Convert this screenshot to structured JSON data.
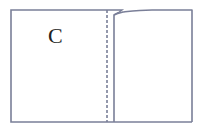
{
  "diagram": {
    "type": "paper-fold",
    "label": "C",
    "colors": {
      "stroke": "#7a7f98",
      "background": "#ffffff",
      "text": "#222222"
    },
    "elements": {
      "outer_rect": {
        "x": 11,
        "y": 10,
        "width": 181,
        "height": 112
      },
      "fold_line_dashed_x": 107,
      "folded_edge_x": 114
    }
  }
}
